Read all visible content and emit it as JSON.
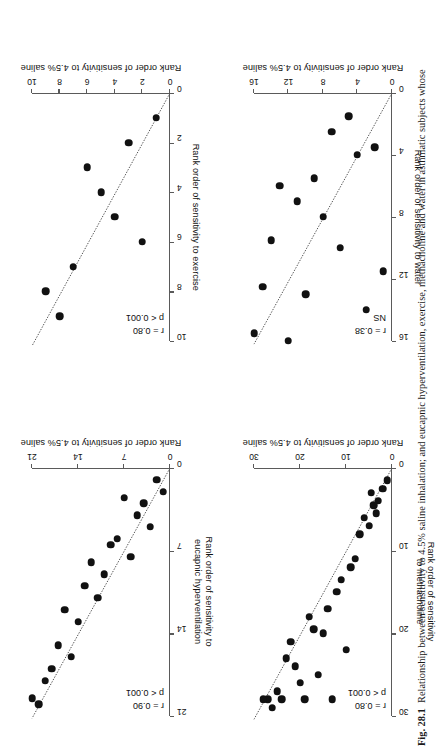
{
  "figure": {
    "number": "Fig. 28.1",
    "caption": "Relationship between sensitivity to 4.5% saline inhalation; and eucapnic hyperventilation, exercise, methacholine and water in asthmatic subjects whose"
  },
  "shared": {
    "x_axis_title": "Rank order of sensitivity to 4.5% saline"
  },
  "chart_data": [
    {
      "id": "exercise",
      "type": "scatter",
      "title": "",
      "xlabel": "Rank order of sensitivity to 4.5% saline",
      "ylabel": "Rank order of sensitivity to exercise",
      "ylabel_lines": [
        "Rank order of sensitivity to exercise"
      ],
      "xlim": [
        0,
        10
      ],
      "ylim": [
        0,
        10
      ],
      "xticks": [
        0,
        2,
        4,
        6,
        8,
        10
      ],
      "yticks": [
        0,
        2,
        4,
        6,
        8,
        10
      ],
      "xticklabels": [
        "0",
        "2",
        "4",
        "6",
        "8",
        "10"
      ],
      "yticklabels": [
        "0",
        "2",
        "4",
        "6",
        "8",
        "10"
      ],
      "grid": false,
      "annotation_r": "r = 0.80",
      "annotation_p": "p < 0.001",
      "points": [
        {
          "x": 1,
          "y": 1
        },
        {
          "x": 2,
          "y": 6
        },
        {
          "x": 3,
          "y": 2
        },
        {
          "x": 4,
          "y": 5
        },
        {
          "x": 5,
          "y": 4
        },
        {
          "x": 6,
          "y": 3
        },
        {
          "x": 7,
          "y": 7
        },
        {
          "x": 8,
          "y": 9
        },
        {
          "x": 9,
          "y": 8
        }
      ],
      "fit_line": {
        "x0": 0,
        "y0": 0,
        "x1": 10,
        "y1": 10.2
      }
    },
    {
      "id": "water",
      "type": "scatter",
      "title": "",
      "xlabel": "Rank order of sensitivity to 4.5% saline",
      "ylabel": "Rank order of sensitivity to water",
      "ylabel_lines": [
        "Rank order of sensitivity to water"
      ],
      "xlim": [
        0,
        16
      ],
      "ylim": [
        0,
        16
      ],
      "xticks": [
        0,
        4,
        8,
        12,
        16
      ],
      "yticks": [
        0,
        4,
        8,
        12,
        16
      ],
      "xticklabels": [
        "0",
        "4",
        "8",
        "12",
        "16"
      ],
      "yticklabels": [
        "0",
        "4",
        "8",
        "12",
        "16"
      ],
      "grid": false,
      "annotation_r": "r = 0.38",
      "annotation_p": "NS",
      "points": [
        {
          "x": 1,
          "y": 11.5
        },
        {
          "x": 2,
          "y": 3.5
        },
        {
          "x": 3,
          "y": 14
        },
        {
          "x": 4,
          "y": 4
        },
        {
          "x": 5,
          "y": 1.5
        },
        {
          "x": 6,
          "y": 10
        },
        {
          "x": 7,
          "y": 2.5
        },
        {
          "x": 8,
          "y": 8
        },
        {
          "x": 9,
          "y": 5.5
        },
        {
          "x": 10,
          "y": 13
        },
        {
          "x": 11,
          "y": 7
        },
        {
          "x": 12,
          "y": 16
        },
        {
          "x": 13,
          "y": 6
        },
        {
          "x": 14,
          "y": 9.5
        },
        {
          "x": 15,
          "y": 12.5
        },
        {
          "x": 16,
          "y": 15.5
        }
      ],
      "fit_line": {
        "x0": 0,
        "y0": 0,
        "x1": 16,
        "y1": 16.2
      }
    },
    {
      "id": "eucapnic-hyperventilation",
      "type": "scatter",
      "title": "",
      "xlabel": "Rank order of sensitivity to 4.5% saline",
      "ylabel": "Rank order of sensitivity to eucapnic hyperventilation",
      "ylabel_lines": [
        "Rank order of sensitivity to",
        "eucapnic hyperventilation"
      ],
      "xlim": [
        0,
        21
      ],
      "ylim": [
        0,
        21
      ],
      "xticks": [
        0,
        7,
        14,
        21
      ],
      "yticks": [
        0,
        7,
        14,
        21
      ],
      "xticklabels": [
        "0",
        "7",
        "14",
        "21"
      ],
      "yticklabels": [
        "0",
        "7",
        "14",
        "21"
      ],
      "grid": false,
      "annotation_r": "r = 0.90",
      "annotation_p": "p < 0.001",
      "points": [
        {
          "x": 1,
          "y": 2
        },
        {
          "x": 2,
          "y": 1
        },
        {
          "x": 3,
          "y": 5
        },
        {
          "x": 4,
          "y": 3
        },
        {
          "x": 5,
          "y": 4
        },
        {
          "x": 6,
          "y": 7.5
        },
        {
          "x": 7,
          "y": 2.5
        },
        {
          "x": 8,
          "y": 6
        },
        {
          "x": 9,
          "y": 6.5
        },
        {
          "x": 10,
          "y": 9
        },
        {
          "x": 11,
          "y": 11
        },
        {
          "x": 12,
          "y": 8
        },
        {
          "x": 13,
          "y": 10
        },
        {
          "x": 14,
          "y": 13
        },
        {
          "x": 15,
          "y": 16
        },
        {
          "x": 16,
          "y": 12
        },
        {
          "x": 17,
          "y": 15
        },
        {
          "x": 18,
          "y": 17
        },
        {
          "x": 19,
          "y": 18
        },
        {
          "x": 20,
          "y": 20
        },
        {
          "x": 21,
          "y": 19.5
        }
      ],
      "fit_line": {
        "x0": 0,
        "y0": 0,
        "x1": 21,
        "y1": 21.2
      }
    },
    {
      "id": "methacholine",
      "type": "scatter",
      "title": "",
      "xlabel": "Rank order of sensitivity to 4.5% saline",
      "ylabel": "Rank order of sensitivity to methacholine",
      "ylabel_lines": [
        "Rank order of sensitivity",
        "to methacholine"
      ],
      "xlim": [
        0,
        30
      ],
      "ylim": [
        0,
        30
      ],
      "xticks": [
        0,
        10,
        20,
        30
      ],
      "yticks": [
        0,
        10,
        20,
        30
      ],
      "xticklabels": [
        "0",
        "10",
        "20",
        "30"
      ],
      "yticklabels": [
        "0",
        "10",
        "20",
        "30"
      ],
      "grid": false,
      "annotation_r": "r = 0.80",
      "annotation_p": "p < 0.001",
      "points": [
        {
          "x": 1,
          "y": 1.5
        },
        {
          "x": 2,
          "y": 2.5
        },
        {
          "x": 3,
          "y": 4
        },
        {
          "x": 3.5,
          "y": 5.5
        },
        {
          "x": 4,
          "y": 4.5
        },
        {
          "x": 4.5,
          "y": 3
        },
        {
          "x": 5,
          "y": 7
        },
        {
          "x": 6,
          "y": 6
        },
        {
          "x": 7,
          "y": 8
        },
        {
          "x": 8,
          "y": 11
        },
        {
          "x": 9,
          "y": 12
        },
        {
          "x": 10,
          "y": 22
        },
        {
          "x": 11,
          "y": 13.5
        },
        {
          "x": 12,
          "y": 15
        },
        {
          "x": 13,
          "y": 28
        },
        {
          "x": 14,
          "y": 17
        },
        {
          "x": 15,
          "y": 20
        },
        {
          "x": 16,
          "y": 25
        },
        {
          "x": 17,
          "y": 19.5
        },
        {
          "x": 18,
          "y": 18
        },
        {
          "x": 19,
          "y": 28
        },
        {
          "x": 20,
          "y": 26
        },
        {
          "x": 21,
          "y": 24
        },
        {
          "x": 22,
          "y": 21
        },
        {
          "x": 23,
          "y": 23
        },
        {
          "x": 24,
          "y": 28
        },
        {
          "x": 25,
          "y": 27
        },
        {
          "x": 26,
          "y": 29
        },
        {
          "x": 27,
          "y": 28
        },
        {
          "x": 28,
          "y": 28
        }
      ],
      "fit_line": {
        "x0": 0,
        "y0": 0,
        "x1": 30,
        "y1": 30.4
      }
    }
  ]
}
